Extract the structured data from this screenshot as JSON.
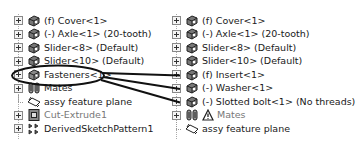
{
  "left_tree": {
    "items": [
      {
        "label": "(f) Cover<1>",
        "icon": "part-icon",
        "expandable": true
      },
      {
        "label": "(-) Axle<1> (20-tooth)",
        "icon": "part-icon",
        "expandable": true
      },
      {
        "label": "Slider<8> (Default)",
        "icon": "part-icon",
        "expandable": true
      },
      {
        "label": "Slider<10> (Default)",
        "icon": "part-icon",
        "expandable": true
      },
      {
        "label": "Fasteners<1>",
        "icon": "subassembly-icon",
        "expandable": true,
        "highlighted": true
      },
      {
        "label": "Mates",
        "icon": "mates-icon",
        "expandable": true
      },
      {
        "label": "assy feature plane",
        "icon": "plane-icon",
        "expandable": false
      },
      {
        "label": "Cut-Extrude1",
        "icon": "cut-extrude-icon",
        "expandable": true,
        "grey": true
      },
      {
        "label": "DerivedSketchPattern1",
        "icon": "pattern-icon",
        "expandable": true
      }
    ]
  },
  "right_tree": {
    "items": [
      {
        "label": "(f) Cover<1>",
        "icon": "part-icon",
        "expandable": true
      },
      {
        "label": "(-) Axle<1> (20-tooth)",
        "icon": "part-icon",
        "expandable": true
      },
      {
        "label": "Slider<8> (Default)",
        "icon": "part-icon",
        "expandable": true
      },
      {
        "label": "Slider<10> (Default)",
        "icon": "part-icon",
        "expandable": true
      },
      {
        "label": "(f) Insert<1>",
        "icon": "part-icon",
        "expandable": true
      },
      {
        "label": "(-) Washer<1>",
        "icon": "part-icon",
        "expandable": true
      },
      {
        "label": "(-) Slotted bolt<1> (No threads)",
        "icon": "part-icon",
        "expandable": true
      },
      {
        "label": "Mates",
        "icon": "mates-warning-icon",
        "expandable": true,
        "grey": true
      },
      {
        "label": "assy feature plane",
        "icon": "plane-icon",
        "expandable": false
      }
    ]
  },
  "annotation": {
    "callout": "ellipse-around-fasteners",
    "arrows_to": [
      "(f) Insert<1>",
      "(-) Washer<1>",
      "(-) Slotted bolt<1> (No threads)"
    ],
    "stroke_color": "#111111"
  }
}
